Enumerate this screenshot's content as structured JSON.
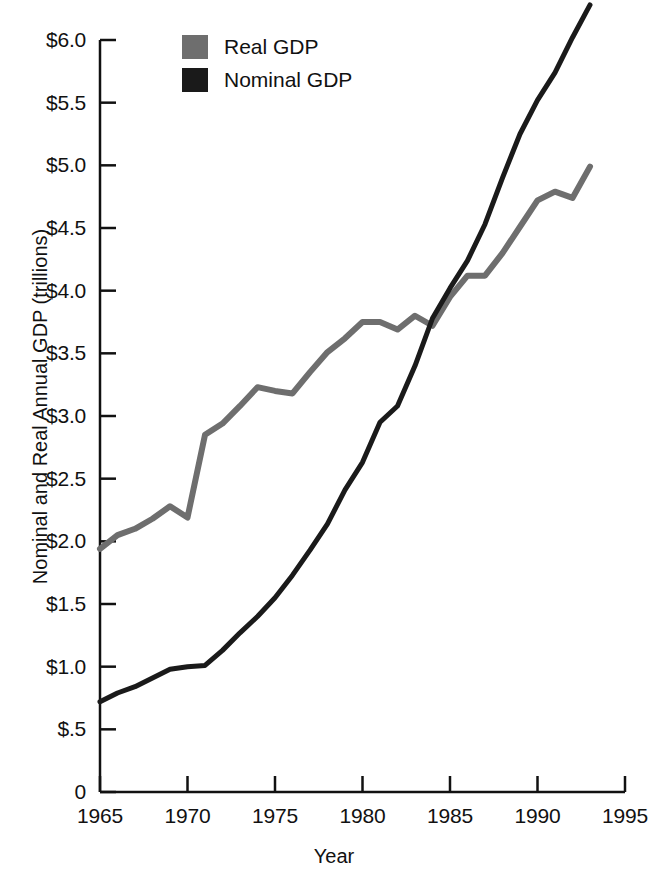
{
  "chart_data": {
    "type": "line",
    "title": "",
    "xlabel": "Year",
    "ylabel": "Nominal and Real Annual GDP (trillions)",
    "xlim": [
      1965,
      1995
    ],
    "ylim": [
      0,
      6.0
    ],
    "grid": false,
    "legend_position": "top-left-inside",
    "xticks": [
      "1965",
      "1970",
      "1975",
      "1980",
      "1985",
      "1990",
      "1995"
    ],
    "xtick_values": [
      1965,
      1970,
      1975,
      1980,
      1985,
      1990,
      1995
    ],
    "yticks": [
      "0",
      "$.5",
      "$1.0",
      "$1.5",
      "$2.0",
      "$2.5",
      "$3.0",
      "$3.5",
      "$4.0",
      "$4.5",
      "$5.0",
      "$5.5",
      "$6.0"
    ],
    "ytick_values": [
      0,
      0.5,
      1.0,
      1.5,
      2.0,
      2.5,
      3.0,
      3.5,
      4.0,
      4.5,
      5.0,
      5.5,
      6.0
    ],
    "x": [
      1965,
      1966,
      1967,
      1968,
      1969,
      1970,
      1971,
      1972,
      1973,
      1974,
      1975,
      1976,
      1977,
      1978,
      1979,
      1980,
      1981,
      1982,
      1983,
      1984,
      1985,
      1986,
      1987,
      1988,
      1989,
      1990,
      1991,
      1992,
      1993
    ],
    "series": [
      {
        "name": "Real GDP",
        "color": "#6e6e6e",
        "values": [
          1.94,
          2.05,
          2.1,
          2.18,
          2.28,
          2.19,
          2.85,
          2.94,
          3.08,
          3.23,
          3.2,
          3.18,
          3.35,
          3.51,
          3.62,
          3.75,
          3.75,
          3.69,
          3.8,
          3.72,
          3.95,
          4.12,
          4.12,
          4.3,
          4.51,
          4.72,
          4.79,
          4.74,
          4.99
        ]
      },
      {
        "name": "Nominal GDP",
        "color": "#1a1a1a",
        "values": [
          0.72,
          0.79,
          0.84,
          0.91,
          0.98,
          1.0,
          1.01,
          1.13,
          1.27,
          1.4,
          1.55,
          1.73,
          1.93,
          2.14,
          2.41,
          2.63,
          2.95,
          3.08,
          3.4,
          3.78,
          4.02,
          4.24,
          4.53,
          4.9,
          5.25,
          5.52,
          5.74,
          6.02,
          6.28
        ]
      }
    ],
    "annotations": []
  },
  "legend": {
    "items": [
      {
        "label": "Real GDP",
        "color": "#6e6e6e"
      },
      {
        "label": "Nominal GDP",
        "color": "#1a1a1a"
      }
    ]
  },
  "axes": {
    "y_title": "Nominal and Real Annual GDP (trillions)",
    "x_title": "Year"
  }
}
